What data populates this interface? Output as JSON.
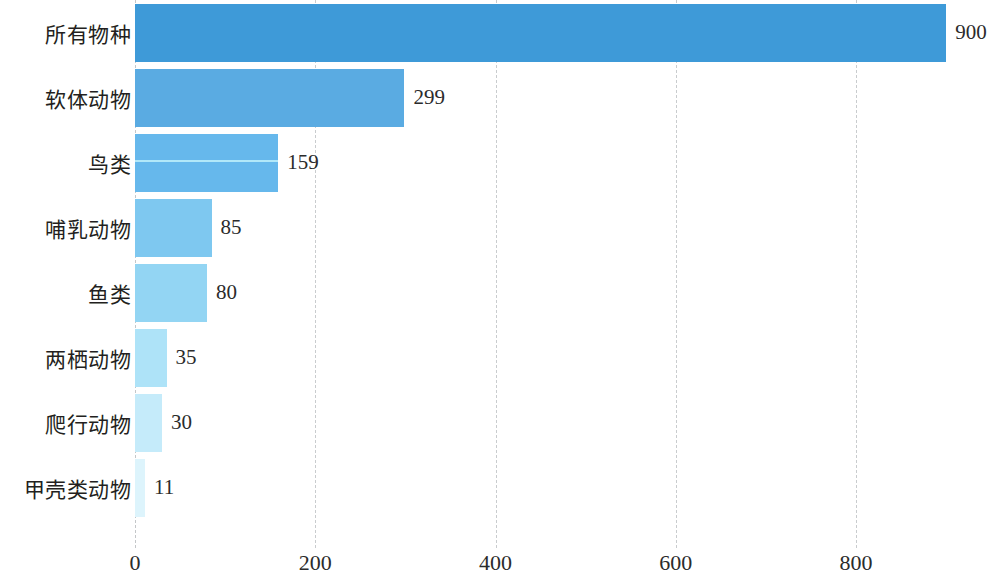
{
  "chart_data": {
    "type": "bar",
    "orientation": "horizontal",
    "title": "",
    "subtitle": "",
    "xlabel": "",
    "ylabel": "",
    "categories": [
      "所有物种",
      "软体动物",
      "鸟类",
      "哺乳动物",
      "鱼类",
      "两栖动物",
      "爬行动物",
      "甲壳类动物"
    ],
    "values": [
      900,
      299,
      159,
      85,
      80,
      35,
      30,
      11
    ],
    "value_labels": [
      "900",
      "299",
      "159",
      "85",
      "80",
      "35",
      "30",
      "11"
    ],
    "xlim": [
      0,
      900
    ],
    "xticks": [
      0,
      200,
      400,
      600,
      800
    ],
    "xtick_labels": [
      "0",
      "200",
      "400",
      "600",
      "800"
    ],
    "grid": "vertical-dashed",
    "legend": null,
    "bar_colors": [
      "#3e9ad8",
      "#5aabe2",
      "#66b8ec",
      "#7ec8f0",
      "#93d5f3",
      "#aee3f8",
      "#c5ebfa",
      "#ddf4fc"
    ],
    "annotations": []
  },
  "axis": {
    "ticks": [
      {
        "label": "0",
        "value": 0
      },
      {
        "label": "200",
        "value": 200
      },
      {
        "label": "400",
        "value": 400
      },
      {
        "label": "600",
        "value": 600
      },
      {
        "label": "800",
        "value": 800
      }
    ]
  },
  "bars": [
    {
      "label": "所有物种",
      "value": 900,
      "value_text": "900",
      "color": "#3e9ad8",
      "streak": false
    },
    {
      "label": "软体动物",
      "value": 299,
      "value_text": "299",
      "color": "#5aabe2",
      "streak": false
    },
    {
      "label": "鸟类",
      "value": 159,
      "value_text": "159",
      "color": "#66b8ec",
      "streak": true
    },
    {
      "label": "哺乳动物",
      "value": 85,
      "value_text": "85",
      "color": "#7ec8f0",
      "streak": false
    },
    {
      "label": "鱼类",
      "value": 80,
      "value_text": "80",
      "color": "#93d5f3",
      "streak": false
    },
    {
      "label": "两栖动物",
      "value": 35,
      "value_text": "35",
      "color": "#aee3f8",
      "streak": false
    },
    {
      "label": "爬行动物",
      "value": 30,
      "value_text": "30",
      "color": "#c5ebfa",
      "streak": false
    },
    {
      "label": "甲壳类动物",
      "value": 11,
      "value_text": "11",
      "color": "#ddf4fc",
      "streak": false
    }
  ]
}
